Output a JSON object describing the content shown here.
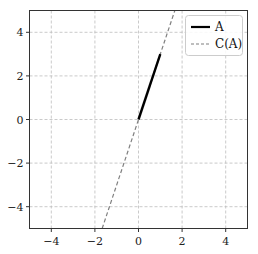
{
  "chart_data": {
    "type": "line",
    "title": "",
    "xlabel": "",
    "ylabel": "",
    "xlim": [
      -5,
      5
    ],
    "ylim": [
      -5,
      5
    ],
    "grid": true,
    "legend_position": "upper right",
    "x_ticks": [
      -4,
      -2,
      0,
      2,
      4
    ],
    "x_tick_labels": [
      "−4",
      "−2",
      "0",
      "2",
      "4"
    ],
    "y_ticks": [
      -4,
      -2,
      0,
      2,
      4
    ],
    "y_tick_labels": [
      "−4",
      "−2",
      "0",
      "2",
      "4"
    ],
    "series": [
      {
        "name": "A",
        "style": "solid",
        "color": "#000000",
        "x": [
          0,
          1
        ],
        "y": [
          0,
          3
        ]
      },
      {
        "name": "C(A)",
        "style": "dashed",
        "color": "#7f7f7f",
        "x": [
          -1.667,
          1.667
        ],
        "y": [
          -5,
          5
        ]
      }
    ]
  },
  "legend": {
    "items": [
      {
        "label": "A"
      },
      {
        "label": "C(A)"
      }
    ]
  }
}
